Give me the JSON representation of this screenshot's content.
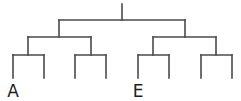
{
  "diagram": {
    "type": "dendrogram",
    "line_color": "#4a4a4a",
    "label_color": "#1e1e1e",
    "root": {
      "x": 122,
      "top": 4,
      "junction_y": 20
    },
    "level1": {
      "y": 20,
      "nodes": [
        {
          "x": 59
        },
        {
          "x": 185
        }
      ]
    },
    "level2": {
      "y": 37,
      "nodes": [
        {
          "x": 28
        },
        {
          "x": 91
        },
        {
          "x": 153
        },
        {
          "x": 216
        }
      ]
    },
    "level3": {
      "y": 55,
      "leaf_bottom": 78,
      "leaves": [
        {
          "x": 13,
          "label": "A"
        },
        {
          "x": 44,
          "label": ""
        },
        {
          "x": 75,
          "label": ""
        },
        {
          "x": 106,
          "label": ""
        },
        {
          "x": 138,
          "label": "E"
        },
        {
          "x": 169,
          "label": ""
        },
        {
          "x": 201,
          "label": ""
        },
        {
          "x": 232,
          "label": ""
        }
      ]
    },
    "labels": [
      {
        "text": "A",
        "x": 13,
        "y": 83
      },
      {
        "text": "E",
        "x": 138,
        "y": 83
      }
    ]
  }
}
